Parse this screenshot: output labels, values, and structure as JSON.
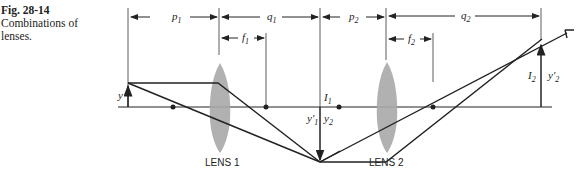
{
  "caption": {
    "figure_number": "Fig. 28-14",
    "text": "Combinations of lenses."
  },
  "dimensions": {
    "p1": "p",
    "p1_sub": "1",
    "q1": "q",
    "q1_sub": "1",
    "p2": "p",
    "p2_sub": "2",
    "q2": "q",
    "q2_sub": "2",
    "f1": "f",
    "f1_sub": "1",
    "f2": "f",
    "f2_sub": "2"
  },
  "labels": {
    "object": "y",
    "image1": "I",
    "image1_sub": "1",
    "y1prime": "y′",
    "y1prime_sub": "1",
    "y2": "y",
    "y2_sub": "2",
    "image2": "I",
    "image2_sub": "2",
    "y2prime": "y′",
    "y2prime_sub": "2"
  },
  "lenses": [
    {
      "label": "LENS 1"
    },
    {
      "label": "LENS 2"
    }
  ],
  "colors": {
    "line": "#222222",
    "lens": "#a9a9a9"
  }
}
